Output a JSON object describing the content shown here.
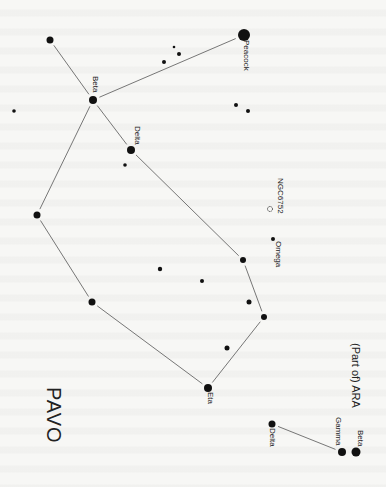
{
  "title": "PAVO",
  "neighbor_label": "(Part of) ARA",
  "colors": {
    "background": "#f7f7f5",
    "star": "#111111",
    "line": "#555555",
    "text": "#222222"
  },
  "labels": {
    "peacock": "Peacock",
    "beta_pavo": "Beta",
    "delta_pavo": "Delta",
    "ngc": "NGC6752",
    "omega": "Omega",
    "eta": "Eta",
    "delta_ara": "Delta",
    "gamma_ara": "Gamma",
    "beta_ara": "Beta"
  },
  "stars": [
    {
      "id": "alpha-peacock",
      "x": 244,
      "y": 35,
      "r": 6
    },
    {
      "id": "top-left",
      "x": 50,
      "y": 40,
      "r": 3.5
    },
    {
      "id": "beta-pavo",
      "x": 93,
      "y": 100,
      "r": 4
    },
    {
      "id": "delta-pavo",
      "x": 131,
      "y": 150,
      "r": 4
    },
    {
      "id": "small-below-delta",
      "x": 125,
      "y": 165,
      "r": 1.8
    },
    {
      "id": "far-left",
      "x": 14,
      "y": 111,
      "r": 1.8
    },
    {
      "id": "cluster-1",
      "x": 174,
      "y": 47,
      "r": 1.3
    },
    {
      "id": "cluster-2",
      "x": 179,
      "y": 54,
      "r": 2
    },
    {
      "id": "cluster-3",
      "x": 164,
      "y": 62,
      "r": 2
    },
    {
      "id": "mid-right-1",
      "x": 236,
      "y": 105,
      "r": 2
    },
    {
      "id": "mid-right-2",
      "x": 248,
      "y": 111,
      "r": 2
    },
    {
      "id": "left-1",
      "x": 37,
      "y": 215,
      "r": 3.5
    },
    {
      "id": "left-2",
      "x": 92,
      "y": 302,
      "r": 3.5
    },
    {
      "id": "center-small",
      "x": 160,
      "y": 269,
      "r": 2.2
    },
    {
      "id": "right-chain-1",
      "x": 243,
      "y": 260,
      "r": 3
    },
    {
      "id": "center-small-2",
      "x": 202,
      "y": 281,
      "r": 2
    },
    {
      "id": "right-small",
      "x": 249,
      "y": 302,
      "r": 2.5
    },
    {
      "id": "right-chain-2",
      "x": 264,
      "y": 317,
      "r": 3
    },
    {
      "id": "lower-small",
      "x": 227,
      "y": 348,
      "r": 2.5
    },
    {
      "id": "eta-pavo",
      "x": 208,
      "y": 388,
      "r": 4
    },
    {
      "id": "omega-pavo",
      "x": 273,
      "y": 239,
      "r": 2
    },
    {
      "id": "delta-ara",
      "x": 272,
      "y": 424,
      "r": 3.5
    },
    {
      "id": "gamma-ara",
      "x": 342,
      "y": 452,
      "r": 4
    },
    {
      "id": "beta-ara",
      "x": 356,
      "y": 452,
      "r": 4.5
    }
  ],
  "lines": [
    {
      "from": "top-left",
      "to": "beta-pavo"
    },
    {
      "from": "beta-pavo",
      "to": "alpha-peacock"
    },
    {
      "from": "beta-pavo",
      "to": "delta-pavo"
    },
    {
      "from": "beta-pavo",
      "to": "left-1"
    },
    {
      "from": "delta-pavo",
      "to": "right-chain-1"
    },
    {
      "from": "right-chain-1",
      "to": "right-chain-2"
    },
    {
      "from": "right-chain-2",
      "to": "eta-pavo"
    },
    {
      "from": "left-1",
      "to": "left-2"
    },
    {
      "from": "left-2",
      "to": "eta-pavo"
    },
    {
      "from": "delta-ara",
      "to": "gamma-ara"
    }
  ],
  "ngc_marker": {
    "x": 270,
    "y": 209,
    "r": 2.5
  }
}
